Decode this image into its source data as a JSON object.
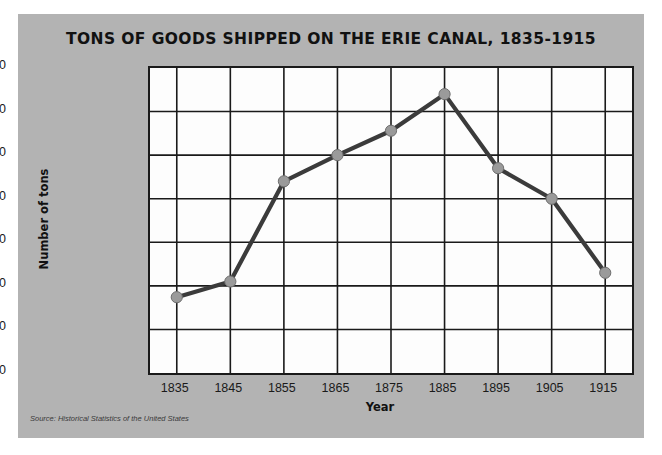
{
  "figure": {
    "background_color": "#b3b3b3",
    "plot_background_color": "#fdfdfd",
    "source_note": "Source: Historical Statistics of the United States"
  },
  "chart_data": {
    "type": "line",
    "title": "TONS OF GOODS SHIPPED ON THE ERIE CANAL, 1835-1915",
    "xlabel": "Year",
    "ylabel": "Number of tons",
    "categories": [
      "1835",
      "1845",
      "1855",
      "1865",
      "1875",
      "1885",
      "1895",
      "1905",
      "1915"
    ],
    "x": [
      1835,
      1845,
      1855,
      1865,
      1875,
      1885,
      1895,
      1905,
      1915
    ],
    "values": [
      870000,
      1050000,
      2200000,
      2500000,
      2780000,
      3200000,
      2350000,
      2000000,
      1150000
    ],
    "ylim": [
      0,
      3500000
    ],
    "ytick_values": [
      0,
      500000,
      1000000,
      1500000,
      2000000,
      2500000,
      3000000,
      3500000
    ],
    "ytick_labels": [
      "0",
      "500,000",
      "1,000,000",
      "1,500,000",
      "2,000,000",
      "2,500,000",
      "3,000,000",
      "3,500,000"
    ],
    "xtick_labels": [
      "1835",
      "1845",
      "1855",
      "1865",
      "1875",
      "1885",
      "1895",
      "1905",
      "1915"
    ],
    "grid": true,
    "legend": false,
    "line_color": "#3b3b3b",
    "marker_color": "#9a9a9a",
    "marker_edge_color": "#6e6e6e",
    "grid_color": "#1a1a1a"
  }
}
